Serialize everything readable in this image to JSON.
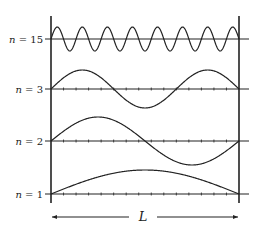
{
  "figure": {
    "length_label": "L",
    "walls": {
      "left_x": 51,
      "right_x": 239,
      "top_y": 16,
      "bottom_y": 203
    },
    "arrow": {
      "y": 217,
      "x_start": 52,
      "x_end": 238
    },
    "modes": [
      {
        "label": "n = 15",
        "n": 15,
        "baseline_y": 39,
        "amplitude": 12
      },
      {
        "label": "n = 3",
        "n": 3,
        "baseline_y": 89,
        "amplitude": 19
      },
      {
        "label": "n = 2",
        "n": 2,
        "baseline_y": 141,
        "amplitude": 24
      },
      {
        "label": "n = 1",
        "n": 1,
        "baseline_y": 194,
        "amplitude": 24
      }
    ],
    "tick_divisions": 15,
    "colors": {
      "ink": "#222222",
      "background": "#ffffff"
    }
  }
}
